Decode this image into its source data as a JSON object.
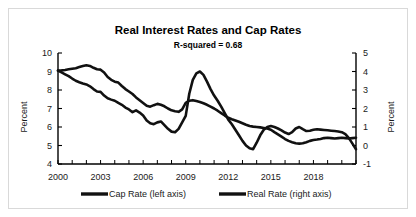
{
  "chart_data": {
    "type": "line",
    "title": "Real Interest Rates and Cap Rates",
    "subtitle": "R-squared = 0.68",
    "xlabel": "",
    "ylabel": "Percent",
    "ylabel_right": "Percent",
    "xlim": [
      2000,
      2021
    ],
    "ylim": [
      4,
      10
    ],
    "ylim_right": [
      -1,
      5
    ],
    "grid": false,
    "legend_position": "bottom",
    "x_tick_labels": [
      "2000",
      "2003",
      "2006",
      "2009",
      "2012",
      "2015",
      "2018"
    ],
    "x_tick_values": [
      2000,
      2003,
      2006,
      2009,
      2012,
      2015,
      2018
    ],
    "x_minor_tick_step": 1,
    "y_tick_labels_left": [
      "10",
      "9",
      "8",
      "7",
      "6",
      "5",
      "4"
    ],
    "y_tick_values_left": [
      10,
      9,
      8,
      7,
      6,
      5,
      4
    ],
    "y_tick_labels_right": [
      "5",
      "4",
      "3",
      "2",
      "1",
      "0",
      "-1"
    ],
    "y_tick_values_right": [
      5,
      4,
      3,
      2,
      1,
      0,
      -1
    ],
    "series": [
      {
        "name": "Cap Rate (left axis)",
        "axis": "left",
        "units": "percent",
        "color": "#111111",
        "x": [
          2000.0,
          2000.25,
          2000.5,
          2000.75,
          2001.0,
          2001.25,
          2001.5,
          2001.75,
          2002.0,
          2002.25,
          2002.5,
          2002.75,
          2003.0,
          2003.25,
          2003.5,
          2003.75,
          2004.0,
          2004.25,
          2004.5,
          2004.75,
          2005.0,
          2005.25,
          2005.5,
          2005.75,
          2006.0,
          2006.25,
          2006.5,
          2006.75,
          2007.0,
          2007.25,
          2007.5,
          2007.75,
          2008.0,
          2008.25,
          2008.5,
          2008.75,
          2009.0,
          2009.25,
          2009.5,
          2009.75,
          2010.0,
          2010.25,
          2010.5,
          2010.75,
          2011.0,
          2011.25,
          2011.5,
          2011.75,
          2012.0,
          2012.25,
          2012.5,
          2012.75,
          2013.0,
          2013.25,
          2013.5,
          2013.75,
          2014.0,
          2014.25,
          2014.5,
          2014.75,
          2015.0,
          2015.25,
          2015.5,
          2015.75,
          2016.0,
          2016.25,
          2016.5,
          2016.75,
          2017.0,
          2017.25,
          2017.5,
          2017.75,
          2018.0,
          2018.25,
          2018.5,
          2018.75,
          2019.0,
          2019.25,
          2019.5,
          2019.75,
          2020.0,
          2020.25,
          2020.5,
          2020.75,
          2021.0
        ],
        "y": [
          9.05,
          9.06,
          9.08,
          9.12,
          9.15,
          9.18,
          9.24,
          9.3,
          9.34,
          9.3,
          9.2,
          9.12,
          9.1,
          8.95,
          8.7,
          8.55,
          8.45,
          8.4,
          8.22,
          8.05,
          7.92,
          7.78,
          7.6,
          7.45,
          7.3,
          7.15,
          7.1,
          7.18,
          7.25,
          7.2,
          7.12,
          7.0,
          6.9,
          6.85,
          6.82,
          6.95,
          7.3,
          7.42,
          7.45,
          7.4,
          7.35,
          7.28,
          7.2,
          7.1,
          7.0,
          6.88,
          6.75,
          6.62,
          6.5,
          6.42,
          6.35,
          6.28,
          6.2,
          6.12,
          6.05,
          6.02,
          6.0,
          5.98,
          5.95,
          5.92,
          5.85,
          5.72,
          5.6,
          5.48,
          5.35,
          5.25,
          5.18,
          5.12,
          5.1,
          5.12,
          5.18,
          5.25,
          5.3,
          5.32,
          5.35,
          5.4,
          5.42,
          5.4,
          5.38,
          5.4,
          5.42,
          5.4,
          5.38,
          5.4,
          5.42
        ]
      },
      {
        "name": "Real Rate (right axis)",
        "axis": "right",
        "units": "percent",
        "color": "#111111",
        "x": [
          2000.0,
          2000.25,
          2000.5,
          2000.75,
          2001.0,
          2001.25,
          2001.5,
          2001.75,
          2002.0,
          2002.25,
          2002.5,
          2002.75,
          2003.0,
          2003.25,
          2003.5,
          2003.75,
          2004.0,
          2004.25,
          2004.5,
          2004.75,
          2005.0,
          2005.25,
          2005.5,
          2005.75,
          2006.0,
          2006.25,
          2006.5,
          2006.75,
          2007.0,
          2007.25,
          2007.5,
          2007.75,
          2008.0,
          2008.25,
          2008.5,
          2008.75,
          2009.0,
          2009.25,
          2009.5,
          2009.75,
          2010.0,
          2010.25,
          2010.5,
          2010.75,
          2011.0,
          2011.25,
          2011.5,
          2011.75,
          2012.0,
          2012.25,
          2012.5,
          2012.75,
          2013.0,
          2013.25,
          2013.5,
          2013.75,
          2014.0,
          2014.25,
          2014.5,
          2014.75,
          2015.0,
          2015.25,
          2015.5,
          2015.75,
          2016.0,
          2016.25,
          2016.5,
          2016.75,
          2017.0,
          2017.25,
          2017.5,
          2017.75,
          2018.0,
          2018.25,
          2018.5,
          2018.75,
          2019.0,
          2019.25,
          2019.5,
          2019.75,
          2020.0,
          2020.25,
          2020.5,
          2020.75,
          2021.0
        ],
        "y": [
          4.05,
          3.95,
          3.85,
          3.75,
          3.62,
          3.5,
          3.42,
          3.35,
          3.3,
          3.2,
          3.05,
          2.92,
          2.9,
          2.7,
          2.55,
          2.48,
          2.42,
          2.3,
          2.2,
          2.05,
          1.95,
          1.8,
          1.9,
          1.78,
          1.62,
          1.35,
          1.2,
          1.15,
          1.25,
          1.3,
          1.1,
          0.9,
          0.75,
          0.72,
          0.9,
          1.25,
          1.6,
          2.8,
          3.55,
          3.9,
          4.0,
          3.82,
          3.45,
          3.05,
          2.7,
          2.42,
          2.1,
          1.75,
          1.4,
          1.15,
          0.85,
          0.55,
          0.25,
          0.0,
          -0.15,
          -0.2,
          0.15,
          0.55,
          0.85,
          1.0,
          1.05,
          1.0,
          0.92,
          0.82,
          0.7,
          0.62,
          0.72,
          0.92,
          1.0,
          0.88,
          0.78,
          0.8,
          0.85,
          0.88,
          0.86,
          0.84,
          0.82,
          0.8,
          0.78,
          0.76,
          0.72,
          0.62,
          0.4,
          0.1,
          -0.2
        ]
      }
    ],
    "legend": [
      {
        "label": "Cap Rate (left axis)",
        "color": "#111111"
      },
      {
        "label": "Real Rate (right axis)",
        "color": "#111111"
      }
    ]
  }
}
